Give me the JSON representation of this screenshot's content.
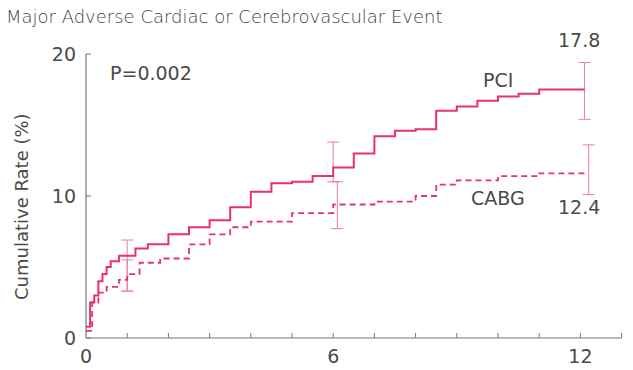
{
  "chart_data": {
    "type": "line",
    "title": "Major Adverse Cardiac or Cerebrovascular Event",
    "xlabel": "",
    "ylabel": "Cumulative Rate (%)",
    "xlim": [
      0,
      13
    ],
    "ylim": [
      0,
      20
    ],
    "x_ticks": [
      0,
      6,
      12
    ],
    "y_ticks": [
      0,
      10,
      20
    ],
    "annotation_p": "P=0.002",
    "series": [
      {
        "name": "PCI",
        "style": "solid",
        "end_label": "17.8",
        "x": [
          0,
          0.1,
          0.2,
          0.3,
          0.4,
          0.5,
          0.6,
          0.8,
          1.0,
          1.2,
          1.5,
          2.0,
          2.5,
          3.0,
          3.5,
          4.0,
          4.5,
          5.0,
          5.5,
          6.0,
          6.5,
          7.0,
          7.5,
          8.0,
          8.5,
          9.0,
          9.5,
          10.0,
          10.5,
          11.0,
          12.1
        ],
        "y": [
          0.8,
          2.5,
          3.0,
          4.0,
          4.5,
          5.0,
          5.4,
          5.8,
          5.8,
          6.3,
          6.6,
          7.3,
          7.8,
          8.3,
          9.2,
          10.3,
          10.9,
          11.0,
          11.4,
          12.0,
          13.0,
          14.2,
          14.6,
          14.7,
          16.0,
          16.3,
          16.7,
          17.0,
          17.2,
          17.5,
          17.5
        ],
        "ci_bars": [
          {
            "x": 1.0,
            "low": 3.3,
            "high": 6.9
          },
          {
            "x": 6.0,
            "low": 11.0,
            "high": 13.8
          },
          {
            "x": 12.1,
            "low": 15.4,
            "high": 19.4
          }
        ]
      },
      {
        "name": "CABG",
        "style": "dashed",
        "end_label": "12.4",
        "x": [
          0,
          0.15,
          0.3,
          0.5,
          0.8,
          1.0,
          1.3,
          1.8,
          2.5,
          3.0,
          3.5,
          4.0,
          5.0,
          6.0,
          7.0,
          8.0,
          8.5,
          9.0,
          10.0,
          11.0,
          12.1
        ],
        "y": [
          0.5,
          2.5,
          3.2,
          3.6,
          4.1,
          4.5,
          5.3,
          5.6,
          6.6,
          7.3,
          7.8,
          8.2,
          8.8,
          9.4,
          9.6,
          10.0,
          10.8,
          11.1,
          11.4,
          11.6,
          11.8
        ],
        "ci_bars": [
          {
            "x": 1.0,
            "low": 3.3,
            "high": 5.5
          },
          {
            "x": 6.1,
            "low": 7.7,
            "high": 11.0
          },
          {
            "x": 12.2,
            "low": 10.1,
            "high": 13.6
          }
        ]
      }
    ],
    "colors": {
      "line": "#e8336a",
      "ci": "#ec7fa0",
      "axis": "#777777"
    }
  }
}
